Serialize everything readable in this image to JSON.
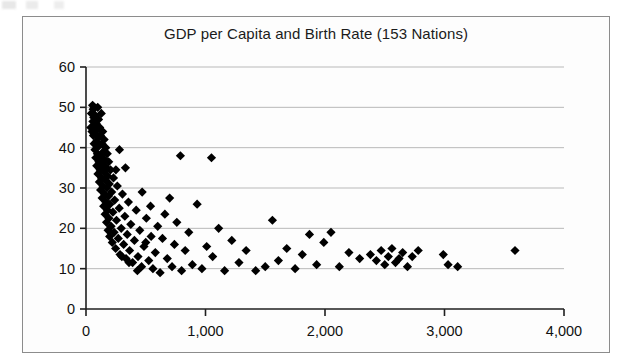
{
  "chart_data": {
    "type": "scatter",
    "title": "GDP per Capita and Birth Rate (153 Nations)",
    "xlabel": "",
    "ylabel": "",
    "xlim": [
      0,
      4000
    ],
    "ylim": [
      0,
      60
    ],
    "xticks": [
      0,
      1000,
      2000,
      3000,
      4000
    ],
    "xtick_labels": [
      "0",
      "1,000",
      "2,000",
      "3,000",
      "4,000"
    ],
    "yticks": [
      0,
      10,
      20,
      30,
      40,
      50,
      60
    ],
    "ytick_labels": [
      "0",
      "10",
      "20",
      "30",
      "40",
      "50",
      "60"
    ],
    "grid": "horizontal",
    "legend": "none",
    "marker": "diamond",
    "marker_color": "#000000",
    "marker_size": 7,
    "n_points": 153,
    "series": [
      {
        "name": "Nations",
        "points": [
          [
            40,
            45.0
          ],
          [
            45,
            48.5
          ],
          [
            50,
            44.0
          ],
          [
            55,
            50.5
          ],
          [
            58,
            46.5
          ],
          [
            60,
            49.5
          ],
          [
            62,
            43.0
          ],
          [
            65,
            47.5
          ],
          [
            68,
            41.0
          ],
          [
            70,
            50.0
          ],
          [
            72,
            45.5
          ],
          [
            75,
            39.5
          ],
          [
            78,
            48.0
          ],
          [
            80,
            43.5
          ],
          [
            82,
            37.5
          ],
          [
            85,
            46.0
          ],
          [
            88,
            41.5
          ],
          [
            90,
            35.5
          ],
          [
            92,
            44.5
          ],
          [
            95,
            38.5
          ],
          [
            98,
            50.0
          ],
          [
            100,
            33.5
          ],
          [
            102,
            42.5
          ],
          [
            105,
            47.0
          ],
          [
            108,
            36.5
          ],
          [
            110,
            40.5
          ],
          [
            112,
            31.5
          ],
          [
            115,
            45.0
          ],
          [
            118,
            34.5
          ],
          [
            120,
            43.0
          ],
          [
            122,
            29.5
          ],
          [
            125,
            38.0
          ],
          [
            128,
            48.5
          ],
          [
            130,
            32.5
          ],
          [
            132,
            41.0
          ],
          [
            135,
            27.5
          ],
          [
            138,
            36.0
          ],
          [
            140,
            44.0
          ],
          [
            142,
            30.5
          ],
          [
            145,
            39.0
          ],
          [
            148,
            25.5
          ],
          [
            150,
            34.0
          ],
          [
            152,
            42.0
          ],
          [
            155,
            28.5
          ],
          [
            158,
            37.0
          ],
          [
            160,
            23.5
          ],
          [
            162,
            32.0
          ],
          [
            165,
            40.0
          ],
          [
            168,
            26.5
          ],
          [
            170,
            35.0
          ],
          [
            172,
            21.5
          ],
          [
            175,
            30.0
          ],
          [
            178,
            38.5
          ],
          [
            180,
            24.5
          ],
          [
            182,
            33.0
          ],
          [
            185,
            19.5
          ],
          [
            188,
            28.0
          ],
          [
            190,
            36.5
          ],
          [
            192,
            22.5
          ],
          [
            195,
            31.0
          ],
          [
            198,
            18.0
          ],
          [
            200,
            26.0
          ],
          [
            205,
            34.5
          ],
          [
            210,
            20.5
          ],
          [
            215,
            29.0
          ],
          [
            220,
            16.5
          ],
          [
            225,
            24.0
          ],
          [
            230,
            32.5
          ],
          [
            235,
            19.0
          ],
          [
            240,
            27.0
          ],
          [
            248,
            15.0
          ],
          [
            255,
            22.0
          ],
          [
            262,
            30.5
          ],
          [
            270,
            17.5
          ],
          [
            278,
            25.0
          ],
          [
            285,
            13.5
          ],
          [
            295,
            20.0
          ],
          [
            305,
            28.5
          ],
          [
            315,
            16.0
          ],
          [
            325,
            23.0
          ],
          [
            335,
            12.5
          ],
          [
            345,
            18.5
          ],
          [
            355,
            26.5
          ],
          [
            365,
            14.5
          ],
          [
            375,
            21.0
          ],
          [
            390,
            11.5
          ],
          [
            405,
            17.0
          ],
          [
            420,
            24.5
          ],
          [
            435,
            13.0
          ],
          [
            450,
            19.5
          ],
          [
            465,
            10.5
          ],
          [
            485,
            15.5
          ],
          [
            505,
            22.5
          ],
          [
            525,
            12.0
          ],
          [
            545,
            18.0
          ],
          [
            250,
            34.5
          ],
          [
            280,
            39.5
          ],
          [
            330,
            35.0
          ],
          [
            300,
            13.0
          ],
          [
            360,
            11.5
          ],
          [
            430,
            9.5
          ],
          [
            470,
            29.0
          ],
          [
            500,
            16.5
          ],
          [
            540,
            25.5
          ],
          [
            560,
            10.0
          ],
          [
            580,
            14.0
          ],
          [
            600,
            20.5
          ],
          [
            620,
            9.0
          ],
          [
            640,
            17.5
          ],
          [
            660,
            23.5
          ],
          [
            680,
            12.5
          ],
          [
            700,
            27.5
          ],
          [
            720,
            10.5
          ],
          [
            740,
            16.0
          ],
          [
            760,
            21.5
          ],
          [
            790,
            38.0
          ],
          [
            800,
            9.5
          ],
          [
            830,
            14.5
          ],
          [
            860,
            19.0
          ],
          [
            890,
            11.0
          ],
          [
            930,
            26.0
          ],
          [
            970,
            10.0
          ],
          [
            1010,
            15.5
          ],
          [
            1050,
            37.5
          ],
          [
            1060,
            13.0
          ],
          [
            1110,
            20.0
          ],
          [
            1160,
            9.5
          ],
          [
            1220,
            17.0
          ],
          [
            1280,
            11.5
          ],
          [
            1340,
            14.5
          ],
          [
            1420,
            9.5
          ],
          [
            1500,
            10.5
          ],
          [
            1560,
            22.0
          ],
          [
            1610,
            12.0
          ],
          [
            1680,
            15.0
          ],
          [
            1750,
            10.0
          ],
          [
            1810,
            13.5
          ],
          [
            1870,
            18.5
          ],
          [
            1930,
            11.0
          ],
          [
            1990,
            16.5
          ],
          [
            2050,
            19.0
          ],
          [
            2120,
            10.5
          ],
          [
            2200,
            14.0
          ],
          [
            2290,
            12.5
          ],
          [
            2380,
            13.5
          ],
          [
            2430,
            12.0
          ],
          [
            2470,
            14.5
          ],
          [
            2500,
            11.0
          ],
          [
            2530,
            13.0
          ],
          [
            2560,
            15.0
          ],
          [
            2590,
            11.5
          ],
          [
            2620,
            12.5
          ],
          [
            2650,
            14.0
          ],
          [
            2690,
            10.5
          ],
          [
            2730,
            13.0
          ],
          [
            2780,
            14.5
          ],
          [
            2990,
            13.5
          ],
          [
            3030,
            11.0
          ],
          [
            3110,
            10.5
          ],
          [
            3590,
            14.5
          ]
        ]
      }
    ]
  }
}
